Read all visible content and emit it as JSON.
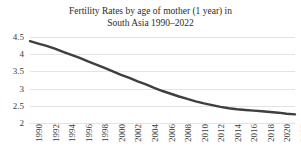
{
  "chart_data": {
    "type": "line",
    "title": "Fertility Rates by age of mother (1 year) in\nSouth Asia 1990–2022",
    "xlabel": "",
    "ylabel": "",
    "ylim": [
      2,
      4.5
    ],
    "xlim": [
      1990,
      2022
    ],
    "grid": true,
    "legend": "none",
    "y_ticks": [
      "4.5",
      "4",
      "3.5",
      "3",
      "2.5",
      "2"
    ],
    "y_tick_values": [
      4.5,
      4,
      3.5,
      3,
      2.5,
      2
    ],
    "x_ticks": [
      "1990",
      "1992",
      "1994",
      "1996",
      "1998",
      "2000",
      "2002",
      "2004",
      "2006",
      "2008",
      "2010",
      "2012",
      "2014",
      "2016",
      "2018",
      "2020",
      "2022"
    ],
    "x": [
      1990,
      1991,
      1992,
      1993,
      1994,
      1995,
      1996,
      1997,
      1998,
      1999,
      2000,
      2001,
      2002,
      2003,
      2004,
      2005,
      2006,
      2007,
      2008,
      2009,
      2010,
      2011,
      2012,
      2013,
      2014,
      2015,
      2016,
      2017,
      2018,
      2019,
      2020,
      2021,
      2022
    ],
    "series": [
      {
        "name": "Fertility rate",
        "color": "#3f3f3f",
        "values": [
          4.38,
          4.31,
          4.24,
          4.16,
          4.07,
          3.98,
          3.89,
          3.79,
          3.7,
          3.6,
          3.5,
          3.4,
          3.31,
          3.21,
          3.12,
          3.02,
          2.93,
          2.85,
          2.77,
          2.7,
          2.63,
          2.57,
          2.52,
          2.47,
          2.43,
          2.4,
          2.38,
          2.36,
          2.34,
          2.32,
          2.3,
          2.27,
          2.25
        ]
      }
    ]
  },
  "colors": {
    "line": "#3f3f3f",
    "grid": "#e3e3e3",
    "text": "#2b2b2b",
    "background": "#ffffff"
  }
}
